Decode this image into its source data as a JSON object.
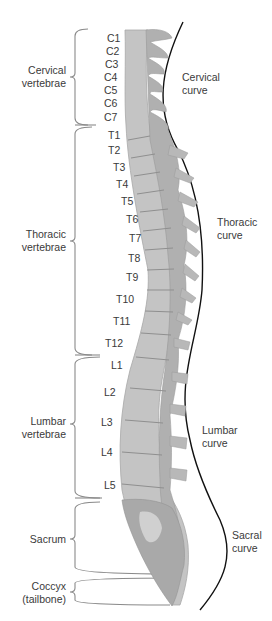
{
  "figure": {
    "colors": {
      "bone": "#b9b9b9",
      "bone_light": "#d8d8d8",
      "bone_dark": "#9a9a9a",
      "bracket": "#8a8a8a",
      "curve_line": "#111111",
      "text": "#3a3a3a"
    }
  },
  "regions": [
    {
      "id": "cervical",
      "label_line1": "Cervical",
      "label_line2": "vertebrae"
    },
    {
      "id": "thoracic",
      "label_line1": "Thoracic",
      "label_line2": "vertebrae"
    },
    {
      "id": "lumbar",
      "label_line1": "Lumbar",
      "label_line2": "vertebrae"
    },
    {
      "id": "sacrum",
      "label_line1": "Sacrum",
      "label_line2": ""
    },
    {
      "id": "coccyx",
      "label_line1": "Coccyx",
      "label_line2": "(tailbone)"
    }
  ],
  "curves": [
    {
      "id": "cervical",
      "label_line1": "Cervical",
      "label_line2": "curve"
    },
    {
      "id": "thoracic",
      "label_line1": "Thoracic",
      "label_line2": "curve"
    },
    {
      "id": "lumbar",
      "label_line1": "Lumbar",
      "label_line2": "curve"
    },
    {
      "id": "sacral",
      "label_line1": "Sacral",
      "label_line2": "curve"
    }
  ],
  "vertebrae": {
    "cervical": [
      "C1",
      "C2",
      "C3",
      "C4",
      "C5",
      "C6",
      "C7"
    ],
    "thoracic": [
      "T1",
      "T2",
      "T3",
      "T4",
      "T5",
      "T6",
      "T7",
      "T8",
      "T9",
      "T10",
      "T11",
      "T12"
    ],
    "lumbar": [
      "L1",
      "L2",
      "L3",
      "L4",
      "L5"
    ]
  }
}
